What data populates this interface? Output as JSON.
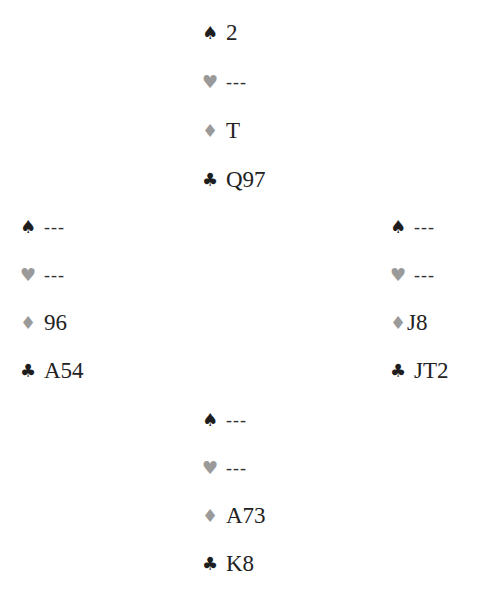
{
  "suits": {
    "spade": {
      "glyph": "♠",
      "color": "#1e1e1e"
    },
    "heart": {
      "glyph": "♥",
      "color": "#9a9a9a"
    },
    "diamond": {
      "glyph": "♦",
      "color": "#9a9a9a"
    },
    "club": {
      "glyph": "♣",
      "color": "#1e1e1e"
    }
  },
  "hands": {
    "north": {
      "spades": "2",
      "hearts": "---",
      "diamonds": "T",
      "clubs": "Q97"
    },
    "west": {
      "spades": "---",
      "hearts": "---",
      "diamonds": "96",
      "clubs": "A54"
    },
    "east": {
      "spades": "---",
      "hearts": "---",
      "diamonds": "J8",
      "clubs": "JT2"
    },
    "south": {
      "spades": "---",
      "hearts": "---",
      "diamonds": "A73",
      "clubs": "K8"
    }
  }
}
